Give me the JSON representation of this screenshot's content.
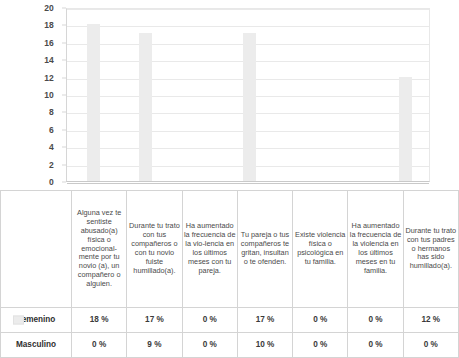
{
  "chart_data": {
    "type": "bar",
    "title": "",
    "subtitle": "",
    "xlabel": "",
    "ylabel": "",
    "ylim": [
      0,
      20
    ],
    "ytick_step": 2,
    "yticks": [
      20,
      18,
      16,
      14,
      12,
      10,
      8,
      6,
      4,
      2,
      0
    ],
    "grid": true,
    "legend_position": "table-left",
    "bar_color": "#ececec",
    "gridline_color": "#e9e9e9",
    "axis_color": "#c9c9c9",
    "categories": [
      "Alguna vez te sentiste abusado(a) física o emocional-mente por tu novio (a), un compañero o alguien.",
      "Durante tu trato con tus compañeros o con tu novio fuiste humillado(a).",
      "Ha aumentado la frecuencia de la vio-lencia en los últimos meses con tu pareja.",
      "Tu pareja o tus compañeros te gritan, insultan o te ofenden.",
      "Existe violencia física o psicológica en tu familia.",
      "Ha aumentado la frecuencia de la violencia en los últimos meses en tu familia.",
      "Durante tu trato con tus padres o hermanos has sido humillado(a)."
    ],
    "series": [
      {
        "name": "Femenino",
        "values": [
          18,
          17,
          0,
          17,
          0,
          0,
          12
        ],
        "labels": [
          "18 %",
          "17 %",
          "0 %",
          "17 %",
          "0 %",
          "0 %",
          "12 %"
        ],
        "plotted": true,
        "swatch": true
      },
      {
        "name": "Masculino",
        "values": [
          0,
          9,
          0,
          10,
          0,
          0,
          0
        ],
        "labels": [
          "0 %",
          "9 %",
          "0 %",
          "10 %",
          "0 %",
          "0 %",
          "0 %"
        ],
        "plotted": false,
        "swatch": false
      }
    ]
  }
}
